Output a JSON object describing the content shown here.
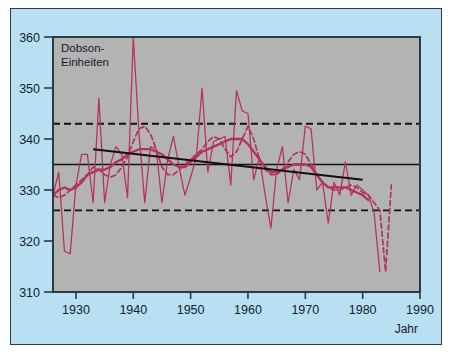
{
  "figure": {
    "background_color": "#b8e0f2",
    "plot_background_color": "#b3b3b3",
    "frame_color": "#2b3a45",
    "series_color": "#b5305a",
    "trend_color": "#111111"
  },
  "chart_data": {
    "type": "line",
    "title": "",
    "subtitle": "",
    "xlabel": "Jahr",
    "ylabel": "Dobson-Einheiten",
    "ylabel_line1": "Dobson-",
    "ylabel_line2": "Einheiten",
    "xlim": [
      1926,
      1990
    ],
    "ylim": [
      310,
      360
    ],
    "xticks": [
      1930,
      1940,
      1950,
      1960,
      1970,
      1980,
      1990
    ],
    "xtick_labels": [
      "1930",
      "1940",
      "1950",
      "1960",
      "1970",
      "1980",
      "1990"
    ],
    "yticks": [
      310,
      320,
      330,
      340,
      350,
      360
    ],
    "ytick_labels": [
      "310",
      "320",
      "330",
      "340",
      "350",
      "360"
    ],
    "grid": false,
    "legend": "none",
    "annotations": [],
    "series": [
      {
        "name": "Jahresmittel",
        "style": "solid-thin",
        "color": "#b5305a",
        "x": [
          1926,
          1927,
          1928,
          1929,
          1930,
          1931,
          1932,
          1933,
          1934,
          1935,
          1936,
          1937,
          1938,
          1939,
          1940,
          1941,
          1942,
          1943,
          1944,
          1945,
          1946,
          1947,
          1948,
          1949,
          1950,
          1951,
          1952,
          1953,
          1954,
          1955,
          1956,
          1957,
          1958,
          1959,
          1960,
          1961,
          1962,
          1963,
          1964,
          1965,
          1966,
          1967,
          1968,
          1969,
          1970,
          1971,
          1972,
          1973,
          1974,
          1975,
          1976,
          1977,
          1978,
          1979,
          1980,
          1981,
          1982,
          1983
        ],
        "values": [
          329.0,
          333.5,
          318.0,
          317.5,
          331.0,
          337.0,
          337.0,
          327.5,
          348.0,
          327.5,
          335.0,
          338.5,
          337.0,
          328.5,
          360.0,
          341.0,
          327.5,
          338.5,
          338.0,
          327.5,
          336.0,
          340.5,
          334.5,
          329.0,
          332.5,
          336.5,
          350.0,
          333.5,
          339.5,
          340.0,
          340.5,
          331.0,
          349.5,
          345.5,
          345.0,
          332.0,
          336.5,
          329.0,
          322.5,
          334.0,
          338.5,
          327.5,
          334.0,
          332.0,
          342.5,
          342.0,
          330.0,
          331.5,
          323.5,
          331.5,
          329.0,
          335.5,
          329.0,
          331.0,
          330.0,
          329.0,
          325.5,
          314.0
        ]
      },
      {
        "name": "Geglaettetes Mittel",
        "style": "solid-thick",
        "color": "#b5305a",
        "x": [
          1926,
          1927,
          1928,
          1929,
          1930,
          1931,
          1932,
          1933,
          1934,
          1935,
          1936,
          1937,
          1938,
          1939,
          1940,
          1941,
          1942,
          1943,
          1944,
          1945,
          1946,
          1947,
          1948,
          1949,
          1950,
          1951,
          1952,
          1953,
          1954,
          1955,
          1956,
          1957,
          1958,
          1959,
          1960,
          1961,
          1962,
          1963,
          1964,
          1965,
          1966,
          1967,
          1968,
          1969,
          1970,
          1971,
          1972,
          1973,
          1974,
          1975,
          1976,
          1977,
          1978,
          1979,
          1980,
          1981
        ],
        "values": [
          329.0,
          330.0,
          330.5,
          330.0,
          330.5,
          331.5,
          333.0,
          333.5,
          334.0,
          334.0,
          334.5,
          335.5,
          336.0,
          337.0,
          337.5,
          338.0,
          338.0,
          338.0,
          337.5,
          337.0,
          336.0,
          335.0,
          334.5,
          334.5,
          335.5,
          336.5,
          337.5,
          338.0,
          338.5,
          339.0,
          339.5,
          340.0,
          340.0,
          340.0,
          339.0,
          337.5,
          336.0,
          334.5,
          333.5,
          333.5,
          334.0,
          334.5,
          335.0,
          335.0,
          335.0,
          334.5,
          333.0,
          331.5,
          330.5,
          330.5,
          330.5,
          330.5,
          330.0,
          329.5,
          329.0,
          328.0
        ]
      },
      {
        "name": "Gestrichelte Reihe",
        "style": "dashed",
        "color": "#b5305a",
        "x": [
          1926,
          1927,
          1928,
          1929,
          1930,
          1931,
          1932,
          1933,
          1934,
          1935,
          1936,
          1937,
          1938,
          1939,
          1940,
          1941,
          1942,
          1943,
          1944,
          1945,
          1946,
          1947,
          1948,
          1949,
          1950,
          1951,
          1952,
          1953,
          1954,
          1955,
          1956,
          1957,
          1958,
          1959,
          1960,
          1961,
          1962,
          1963,
          1964,
          1965,
          1966,
          1967,
          1968,
          1969,
          1970,
          1971,
          1972,
          1973,
          1974,
          1975,
          1976,
          1977,
          1978,
          1979,
          1980,
          1981,
          1982,
          1983,
          1984,
          1985
        ],
        "values": [
          329.0,
          328.5,
          329.0,
          330.0,
          331.0,
          332.0,
          333.0,
          334.5,
          334.0,
          333.0,
          332.5,
          333.0,
          334.5,
          336.5,
          339.5,
          342.0,
          342.5,
          341.0,
          338.0,
          334.5,
          333.0,
          333.0,
          334.0,
          335.0,
          336.0,
          337.0,
          338.0,
          339.5,
          340.5,
          340.0,
          338.0,
          336.5,
          337.5,
          340.0,
          342.5,
          340.0,
          336.0,
          334.0,
          333.0,
          333.0,
          334.0,
          335.5,
          337.0,
          337.5,
          337.0,
          335.0,
          333.0,
          331.5,
          330.5,
          330.0,
          330.0,
          330.5,
          331.0,
          330.5,
          329.5,
          329.0,
          327.5,
          326.0,
          314.0,
          331.0
        ]
      }
    ],
    "reference_lines": [
      {
        "name": "obere-grenze",
        "style": "dashed",
        "color": "#111111",
        "value": 343.0,
        "x_start": 1926,
        "x_end": 1990
      },
      {
        "name": "untere-grenze",
        "style": "dashed",
        "color": "#111111",
        "value": 326.0,
        "x_start": 1926,
        "x_end": 1990
      },
      {
        "name": "mittelwert",
        "style": "solid",
        "color": "#111111",
        "value": 335.0,
        "x_start": 1926,
        "x_end": 1990
      }
    ],
    "trend_lines": [
      {
        "name": "trendgerade",
        "style": "solid",
        "color": "#111111",
        "x_start": 1933,
        "y_start": 338.0,
        "x_end": 1980,
        "y_end": 332.0
      }
    ]
  }
}
